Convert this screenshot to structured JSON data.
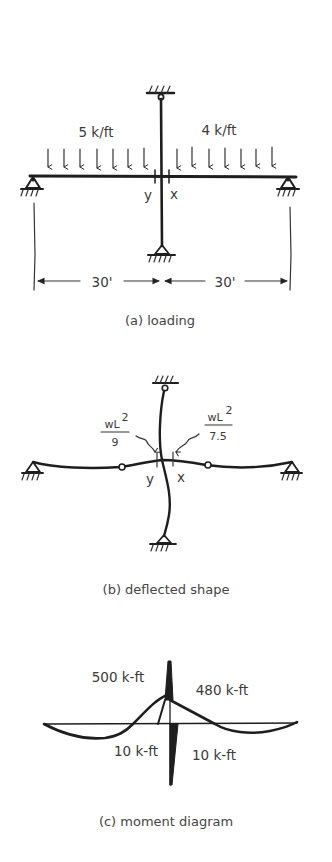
{
  "figure": {
    "panels": [
      {
        "id": "a",
        "caption": "(a) loading",
        "loads": [
          {
            "label": "5 k/ft",
            "side": "left",
            "arrow_count": 7
          },
          {
            "label": "4 k/ft",
            "side": "right",
            "arrow_count": 7
          }
        ],
        "joint_labels": {
          "left": "y",
          "right": "x"
        },
        "dimensions": [
          {
            "label": "30'",
            "side": "left"
          },
          {
            "label": "30'",
            "side": "right"
          }
        ]
      },
      {
        "id": "b",
        "caption": "(b) deflected shape",
        "rotations": [
          {
            "numerator": "wL",
            "exponent": "2",
            "denominator": "9",
            "side": "left"
          },
          {
            "numerator": "wL",
            "exponent": "2",
            "denominator": "7.5",
            "side": "right"
          }
        ],
        "joint_labels": {
          "left": "y",
          "right": "x"
        },
        "hinges": 2
      },
      {
        "id": "c",
        "caption": "(c) moment diagram",
        "moments": [
          {
            "label": "500 k-ft",
            "position": "beam-left-at-joint"
          },
          {
            "label": "480 k-ft",
            "position": "beam-right-at-joint"
          },
          {
            "label": "10 k-ft",
            "position": "column-left"
          },
          {
            "label": "10 k-ft",
            "position": "column-right"
          }
        ]
      }
    ]
  },
  "colors": {
    "ink": "#1e1e1e",
    "text": "#3a3a3a",
    "background": "#ffffff"
  }
}
